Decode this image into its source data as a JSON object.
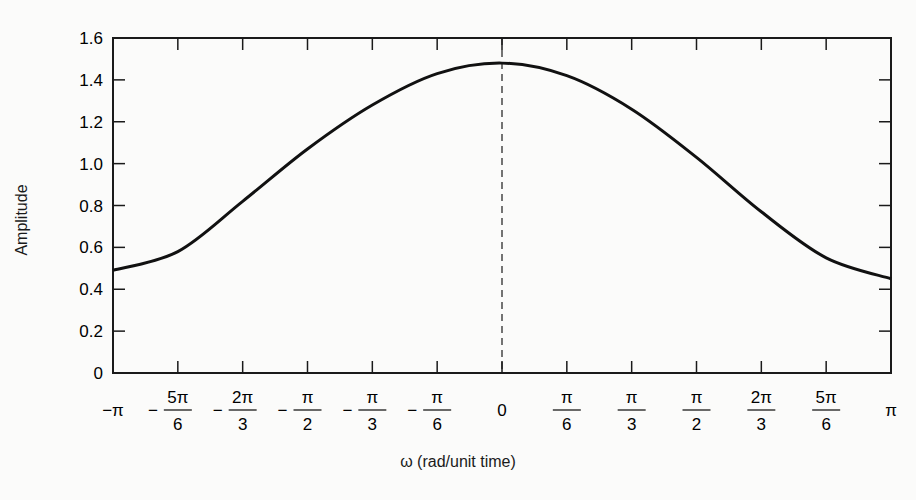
{
  "chart_data": {
    "type": "line",
    "title": "",
    "xlabel": "ω (rad/unit time)",
    "ylabel": "Amplitude",
    "ylim": [
      0,
      1.6
    ],
    "xlim": [
      -3.14159,
      3.14159
    ],
    "grid": false,
    "legend": null,
    "yticks": [
      "0",
      "0.2",
      "0.4",
      "0.6",
      "0.8",
      "1.0",
      "1.2",
      "1.4",
      "1.6"
    ],
    "xticks": [
      {
        "sign": "−",
        "num": "π",
        "den": ""
      },
      {
        "sign": "−",
        "num": "5π",
        "den": "6"
      },
      {
        "sign": "−",
        "num": "2π",
        "den": "3"
      },
      {
        "sign": "−",
        "num": "π",
        "den": "2"
      },
      {
        "sign": "−",
        "num": "π",
        "den": "3"
      },
      {
        "sign": "−",
        "num": "π",
        "den": "6"
      },
      {
        "sign": "",
        "num": "0",
        "den": ""
      },
      {
        "sign": "",
        "num": "π",
        "den": "6"
      },
      {
        "sign": "",
        "num": "π",
        "den": "3"
      },
      {
        "sign": "",
        "num": "π",
        "den": "2"
      },
      {
        "sign": "",
        "num": "2π",
        "den": "3"
      },
      {
        "sign": "",
        "num": "5π",
        "den": "6"
      },
      {
        "sign": "",
        "num": "π",
        "den": ""
      }
    ],
    "annotations": [
      {
        "type": "vertical-dashed-line",
        "x": 0
      }
    ],
    "series": [
      {
        "name": "Amplitude",
        "x": [
          -3.1416,
          -2.618,
          -2.0944,
          -1.5708,
          -1.0472,
          -0.5236,
          0,
          0.5236,
          1.0472,
          1.5708,
          2.0944,
          2.618,
          3.1416
        ],
        "values": [
          0.49,
          0.58,
          0.82,
          1.07,
          1.28,
          1.43,
          1.48,
          1.42,
          1.26,
          1.03,
          0.77,
          0.55,
          0.45
        ]
      }
    ]
  },
  "axis": {
    "x_title": "ω (rad/unit time)",
    "y_title": "Amplitude"
  }
}
